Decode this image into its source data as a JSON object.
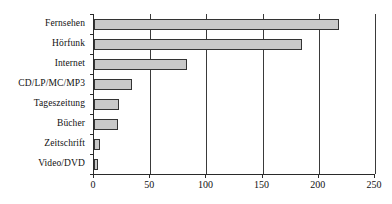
{
  "chart_data": {
    "type": "bar",
    "orientation": "horizontal",
    "title": "",
    "subtitle": "",
    "xlabel": "",
    "ylabel": "",
    "categories": [
      "Fernsehen",
      "Hörfunk",
      "Internet",
      "CD/LP/MC/MP3",
      "Tageszeitung",
      "Bücher",
      "Zeitschrift",
      "Video/DVD"
    ],
    "values": [
      218,
      185,
      83,
      34,
      22,
      21,
      5,
      4
    ],
    "xlim": [
      0,
      250
    ],
    "xticks": [
      0,
      50,
      100,
      150,
      200,
      250
    ],
    "xtick_labels": [
      "0",
      "50",
      "100",
      "150",
      "200",
      "250"
    ],
    "grid": "vertical",
    "legend": "none",
    "bar_fill": "#c8c8c8",
    "bar_border": "#333333",
    "axis_color": "#2a2a2a"
  }
}
